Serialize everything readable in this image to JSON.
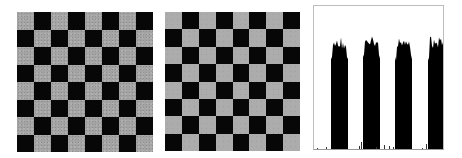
{
  "panels": [
    {
      "name": "noisy-checkerboard",
      "rows": 8,
      "cols": 8,
      "dark_color": "#070707",
      "light_color": "#a3a3a3",
      "first_cell": "light"
    },
    {
      "name": "smoothed-checkerboard",
      "rows": 8,
      "cols": 8,
      "dark_color": "#070707",
      "light_color": "#acacac",
      "first_cell": "light"
    },
    {
      "name": "histogram"
    }
  ],
  "chart_data": {
    "type": "bar",
    "title": "",
    "xlabel": "",
    "ylabel": "",
    "grid": false,
    "legend": "none",
    "x": [
      0,
      1,
      2,
      3
    ],
    "categories": [
      "peak 1",
      "peak 2",
      "peak 3",
      "peak 4"
    ],
    "series": [
      {
        "name": "counts",
        "values": [
          0.8,
          0.82,
          0.81,
          0.8
        ]
      }
    ],
    "peak_x_ranges_px": [
      [
        17,
        34
      ],
      [
        49,
        66
      ],
      [
        81,
        98
      ],
      [
        114,
        131
      ]
    ],
    "ylim": [
      0,
      1
    ],
    "bar_color": "#000000"
  }
}
